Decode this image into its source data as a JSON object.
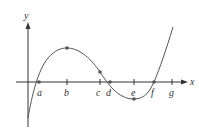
{
  "axes": {
    "x_label": "x",
    "y_label": "y"
  },
  "points": [
    {
      "label": "a",
      "x": 39
    },
    {
      "label": "b",
      "x": 67
    },
    {
      "label": "c",
      "x": 100
    },
    {
      "label": "d",
      "x": 110
    },
    {
      "label": "e",
      "x": 134
    },
    {
      "label": "f",
      "x": 154
    },
    {
      "label": "g",
      "x": 172
    }
  ],
  "colors": {
    "curve": "#555555",
    "axis": "#333333",
    "dot": "#555555"
  }
}
